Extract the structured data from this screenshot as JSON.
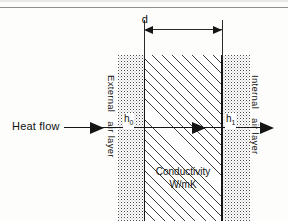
{
  "figure": {
    "type": "wall-heat-transfer-cross-section",
    "dimension": {
      "label": "d",
      "meaning": "wall thickness"
    },
    "heat_flow": {
      "label": "Heat flow",
      "direction": "left-to-right",
      "arrow_count": 3
    },
    "layers": {
      "external": {
        "line1": "External",
        "line2": "air layer",
        "coefficient": "h",
        "coefficient_subscript": "0"
      },
      "internal": {
        "line1": "Internal",
        "line2": "air layer",
        "coefficient": "h",
        "coefficient_subscript": "1"
      },
      "core": {
        "line1": "Conductivity",
        "line2": "W/mK"
      }
    },
    "colors": {
      "ink": "#151515",
      "hatch": "#3c3c3c",
      "stipple": "#4a4a4a",
      "rule": "#8e8e8e",
      "background": "#fdfdfc"
    }
  }
}
